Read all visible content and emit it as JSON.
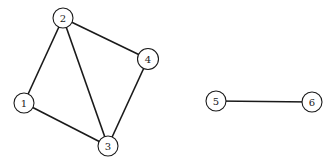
{
  "diagram": {
    "type": "undirected-graph",
    "nodes": [
      {
        "id": "1",
        "label": "1",
        "x": 24,
        "y": 103,
        "r": 10
      },
      {
        "id": "2",
        "label": "2",
        "x": 63,
        "y": 18,
        "r": 10
      },
      {
        "id": "3",
        "label": "3",
        "x": 108,
        "y": 146,
        "r": 10
      },
      {
        "id": "4",
        "label": "4",
        "x": 148,
        "y": 59,
        "r": 10.5
      },
      {
        "id": "5",
        "label": "5",
        "x": 216,
        "y": 101,
        "r": 10
      },
      {
        "id": "6",
        "label": "6",
        "x": 312,
        "y": 102,
        "r": 10
      }
    ],
    "edges": [
      {
        "from": "1",
        "to": "2"
      },
      {
        "from": "1",
        "to": "3"
      },
      {
        "from": "2",
        "to": "3"
      },
      {
        "from": "2",
        "to": "4"
      },
      {
        "from": "3",
        "to": "4"
      },
      {
        "from": "5",
        "to": "6"
      }
    ],
    "colors": {
      "stroke": "#1a1a1a",
      "node_fill": "#ffffff",
      "background": "#ffffff"
    }
  }
}
